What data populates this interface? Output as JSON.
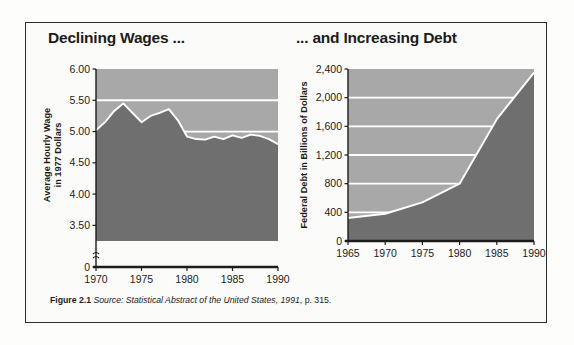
{
  "figure": {
    "caption_label": "Figure 2.1",
    "caption_source_italic": "Source: Statistical Abstract of the United States, 1991",
    "caption_tail": ", p. 315."
  },
  "colors": {
    "area_fill": "#6f6f6f",
    "plot_background": "#a8a8a8",
    "gridline": "#ffffff",
    "outline": "#ffffff",
    "axis": "#1c1c1c",
    "frame": "#2b2b2b",
    "page": "#fbfbf9",
    "text": "#1c1c1c"
  },
  "left_panel": {
    "title": "Declining Wages ..."
  },
  "right_panel": {
    "title": "... and Increasing Debt"
  },
  "chart_data": [
    {
      "type": "area",
      "id": "declining-wages",
      "title": "Declining Wages ...",
      "xlabel": "",
      "ylabel": "Average Hourly Wage in 1977 Dollars",
      "ylabel_line1": "Average Hourly Wage",
      "ylabel_line2": "in 1977 Dollars",
      "x": [
        1970,
        1971,
        1972,
        1973,
        1974,
        1975,
        1976,
        1977,
        1978,
        1979,
        1980,
        1981,
        1982,
        1983,
        1984,
        1985,
        1986,
        1987,
        1988,
        1989,
        1990
      ],
      "values": [
        5.02,
        5.15,
        5.33,
        5.45,
        5.3,
        5.15,
        5.25,
        5.3,
        5.36,
        5.18,
        4.92,
        4.88,
        4.87,
        4.92,
        4.88,
        4.94,
        4.9,
        4.95,
        4.93,
        4.88,
        4.8
      ],
      "ylim": [
        3.25,
        6.0
      ],
      "yticks": [
        0,
        3.5,
        4.0,
        4.5,
        5.0,
        5.5,
        6.0
      ],
      "ytick_labels": [
        "0",
        "3.50",
        "4.00",
        "4.50",
        "5.00",
        "5.50",
        "6.00"
      ],
      "gridlines": [
        5.0,
        5.5
      ],
      "xlim": [
        1970,
        1990
      ],
      "xticks": [
        1970,
        1975,
        1980,
        1985,
        1990
      ],
      "xtick_labels": [
        "1970",
        "1975",
        "1980",
        "1985",
        "1990"
      ],
      "axis_break": true,
      "grid": true,
      "legend": "none"
    },
    {
      "type": "area",
      "id": "increasing-debt",
      "title": "... and Increasing Debt",
      "xlabel": "",
      "ylabel": "Federal Debt in Billions of Dollars",
      "x": [
        1965,
        1970,
        1975,
        1980,
        1985,
        1990
      ],
      "values": [
        320,
        380,
        540,
        800,
        1700,
        2350
      ],
      "ylim": [
        0,
        2400
      ],
      "yticks": [
        0,
        400,
        800,
        1200,
        1600,
        2000,
        2400
      ],
      "ytick_labels": [
        "0",
        "400",
        "800",
        "1,200",
        "1,600",
        "2,000",
        "2,400"
      ],
      "gridlines": [
        400,
        800,
        1200,
        1600,
        2000
      ],
      "xlim": [
        1965,
        1990
      ],
      "xticks": [
        1965,
        1970,
        1975,
        1980,
        1985,
        1990
      ],
      "xtick_labels": [
        "1965",
        "1970",
        "1975",
        "1980",
        "1985",
        "1990"
      ],
      "axis_break": false,
      "grid": true,
      "legend": "none"
    }
  ]
}
